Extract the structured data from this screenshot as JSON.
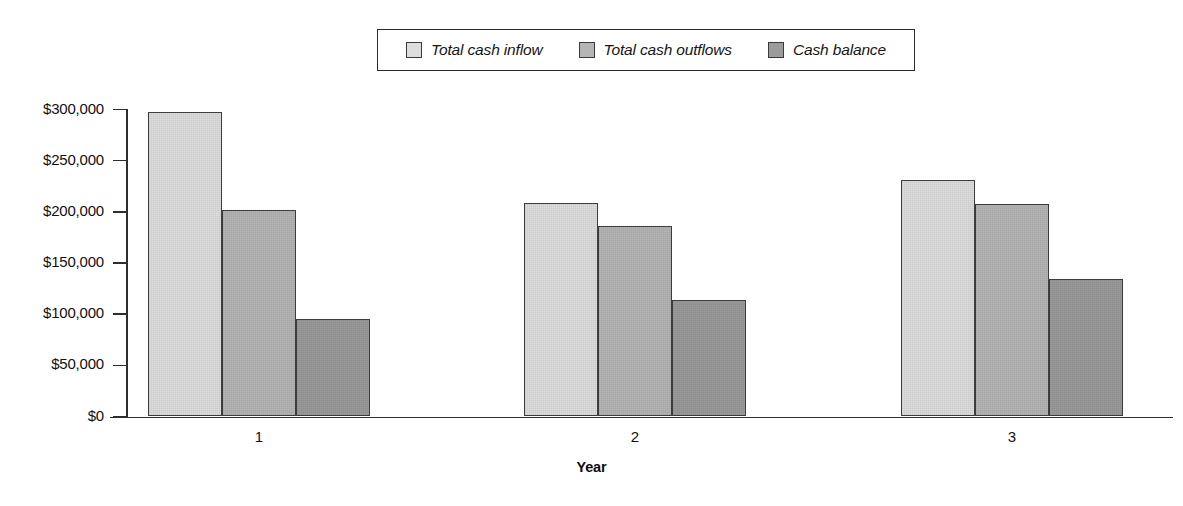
{
  "chart_data": {
    "type": "bar",
    "title": "",
    "subtitle": "",
    "xlabel": "Year",
    "ylabel": "",
    "categories": [
      "1",
      "2",
      "3"
    ],
    "series": [
      {
        "name": "Total cash inflow",
        "color": "#dedede",
        "values": [
          298000,
          209000,
          231000
        ]
      },
      {
        "name": "Total cash outflows",
        "color": "#b5b5b5",
        "values": [
          202000,
          186000,
          208000
        ]
      },
      {
        "name": "Cash balance",
        "color": "#9b9b9b",
        "values": [
          95000,
          114000,
          134000
        ]
      }
    ],
    "ylim": [
      0,
      300000
    ],
    "ytick_values": [
      0,
      50000,
      100000,
      150000,
      200000,
      250000,
      300000
    ],
    "ytick_labels": [
      "$0",
      "$50,000",
      "$100,000",
      "$150,000",
      "$200,000",
      "$250,000",
      "$300,000"
    ],
    "grid": false,
    "legend_position": "top-center",
    "legend_italic": true
  },
  "legend": {
    "entries": [
      {
        "label": "Total cash inflow",
        "swatch": "legend-swatch-inflow"
      },
      {
        "label": "Total cash outflows",
        "swatch": "legend-swatch-outflows"
      },
      {
        "label": "Cash balance",
        "swatch": "legend-swatch-balance"
      }
    ]
  },
  "axes": {
    "x_title": "Year",
    "y_tick_labels": [
      "$300,000",
      "$250,000",
      "$200,000",
      "$150,000",
      "$100,000",
      "$50,000",
      "$0"
    ],
    "x_tick_labels": [
      "1",
      "2",
      "3"
    ]
  }
}
